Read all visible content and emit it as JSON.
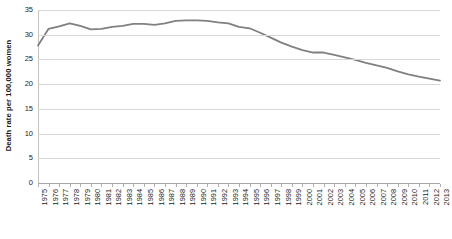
{
  "chart_data": {
    "type": "line",
    "title": "",
    "xlabel": "",
    "ylabel": "Death rate per 100,000 women",
    "ylim": [
      0,
      35
    ],
    "ytick_step": 5,
    "yticks": [
      0,
      5,
      10,
      15,
      20,
      25,
      30,
      35
    ],
    "grid": true,
    "legend": "none",
    "line_color": "#808080",
    "categories": [
      "1975",
      "1976",
      "1977",
      "1978",
      "1979",
      "1980",
      "1981",
      "1982",
      "1983",
      "1984",
      "1985",
      "1986",
      "1987",
      "1988",
      "1989",
      "1990",
      "1991",
      "1992",
      "1993",
      "1994",
      "1995",
      "1996",
      "1997",
      "1998",
      "1999",
      "2000",
      "2001",
      "2002",
      "2003",
      "2004",
      "2005",
      "2006",
      "2007",
      "2008",
      "2009",
      "2010",
      "2011",
      "2012",
      "2013"
    ],
    "values": [
      27.8,
      31.2,
      31.7,
      32.3,
      31.8,
      31.1,
      31.2,
      31.6,
      31.8,
      32.2,
      32.2,
      32.0,
      32.3,
      32.8,
      32.9,
      32.9,
      32.8,
      32.5,
      32.3,
      31.6,
      31.3,
      30.4,
      29.4,
      28.4,
      27.6,
      26.9,
      26.4,
      26.4,
      25.9,
      25.4,
      24.9,
      24.3,
      23.8,
      23.3,
      22.6,
      22.0,
      21.5,
      21.1,
      20.7
    ]
  }
}
